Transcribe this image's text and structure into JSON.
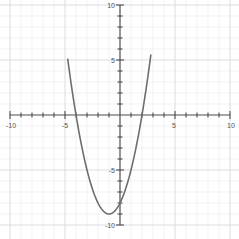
{
  "graph": {
    "title": "",
    "background_color": "#ffffff",
    "axis_color": "#4d4d4d",
    "grid_minor_color": "#ededf2",
    "grid_major_color": "#d8d8e0",
    "curve_color": "#6e6e6e",
    "label_color": "#555555",
    "x_axis": {
      "min": -10,
      "max": 10,
      "tick_interval": 1,
      "labels": [
        {
          "value": -10,
          "text": "-10"
        },
        {
          "value": -5,
          "text": "-5"
        },
        {
          "value": 5,
          "text": "5"
        },
        {
          "value": 10,
          "text": "10"
        }
      ]
    },
    "y_axis": {
      "min": -10,
      "max": 10,
      "tick_interval": 1,
      "labels": [
        {
          "value": 10,
          "text": "10"
        },
        {
          "value": 5,
          "text": "5"
        },
        {
          "value": -5,
          "text": "-5"
        },
        {
          "value": -10,
          "text": "-10"
        }
      ]
    }
  },
  "chart_data": {
    "type": "line",
    "title": "",
    "xlabel": "",
    "ylabel": "",
    "xlim": [
      -10,
      10
    ],
    "ylim": [
      -10,
      10
    ],
    "grid": true,
    "legend": "none",
    "series": [
      {
        "name": "parabola",
        "equation": "y = x^2 + 2x - 8",
        "vertex": [
          -1,
          -9
        ],
        "roots": [
          -4,
          2
        ],
        "y_intercept": -8,
        "color": "#6e6e6e",
        "x": [
          -4.3,
          -4.2,
          -4.0,
          -3.8,
          -3.6,
          -3.4,
          -3.2,
          -3.0,
          -2.8,
          -2.6,
          -2.4,
          -2.2,
          -2.0,
          -1.8,
          -1.6,
          -1.4,
          -1.2,
          -1.0,
          -0.8,
          -0.6,
          -0.4,
          -0.2,
          0.0,
          0.2,
          0.4,
          0.6,
          0.8,
          1.0,
          1.2,
          1.4,
          1.6,
          1.8,
          2.0,
          2.2,
          2.3
        ],
        "y": [
          1.89,
          0.96,
          0.0,
          -1.16,
          -2.24,
          -3.24,
          -4.16,
          -5.0,
          -5.76,
          -6.44,
          -7.04,
          -7.56,
          -8.0,
          -8.36,
          -8.64,
          -8.84,
          -8.96,
          -9.0,
          -8.96,
          -8.84,
          -8.64,
          -8.36,
          -8.0,
          -7.56,
          -7.04,
          -6.44,
          -5.76,
          -5.0,
          -4.16,
          -3.24,
          -2.24,
          -1.16,
          0.0,
          1.24,
          1.89
        ]
      }
    ]
  }
}
